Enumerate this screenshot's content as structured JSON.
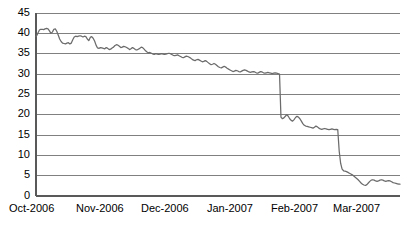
{
  "chart_data": {
    "type": "line",
    "title": "",
    "subtitle": "",
    "xlabel": "",
    "ylabel": "",
    "ylim": [
      0,
      45
    ],
    "yticks": [
      0,
      5,
      10,
      15,
      20,
      25,
      30,
      35,
      40,
      45
    ],
    "ytick_labels": [
      "0",
      "5",
      "10",
      "15",
      "20",
      "25",
      "30",
      "35",
      "40",
      "45"
    ],
    "xtick_labels": [
      "Oct-2006",
      "Nov-2006",
      "Dec-2006",
      "Jan-2007",
      "Feb-2007",
      "Mar-2007"
    ],
    "grid": "horizontal",
    "legend": "none",
    "series": [
      {
        "name": "value",
        "color": "#6b6b6b",
        "x": [
          0.0,
          0.3,
          0.6,
          0.95,
          1.3,
          1.7,
          2.1,
          2.5,
          2.9,
          3.3,
          3.7,
          4.1,
          4.5,
          4.9,
          5.3,
          5.7,
          6.1,
          6.5,
          6.9,
          7.3,
          7.7,
          8.1,
          8.5,
          8.9,
          9.3,
          9.7,
          10.1,
          10.5,
          10.9,
          11.3,
          11.7,
          12.1,
          12.5,
          12.9,
          13.3,
          13.7,
          14.1,
          14.5,
          14.9,
          15.3,
          15.7,
          16.1,
          16.5,
          16.9,
          17.3,
          17.7,
          18.1,
          18.5,
          18.9,
          19.3,
          19.7,
          20.1,
          20.5,
          20.9,
          21.3,
          21.7,
          22.1,
          22.5,
          22.9,
          23.3,
          23.7,
          24.1,
          24.5,
          24.9,
          25.3,
          25.7,
          26.1,
          26.5,
          26.9,
          27.3,
          27.7,
          28.1,
          28.5,
          28.9,
          29.3,
          29.7,
          30.1,
          30.5,
          30.9,
          31.3,
          31.7,
          32.1,
          32.5,
          32.9,
          33.3,
          33.7,
          34.1,
          34.5,
          34.9,
          35.3,
          35.7,
          36.1,
          36.5,
          36.9,
          37.3,
          37.7,
          38.1,
          38.5,
          38.9,
          39.3,
          39.7,
          40.1,
          40.5,
          40.9,
          41.3,
          41.7,
          42.1,
          42.5,
          42.9,
          43.3,
          43.7,
          44.1,
          44.5,
          44.9,
          45.3,
          45.7,
          46.1,
          46.5,
          46.9,
          47.3,
          47.7,
          48.1,
          48.5,
          48.9,
          49.3,
          49.7,
          50.1,
          50.5,
          50.9,
          51.3,
          51.7,
          52.1,
          52.5,
          52.9,
          53.3,
          53.7,
          54.1,
          54.5,
          54.9,
          55.3,
          55.7,
          56.1,
          56.5,
          56.9,
          57.3,
          57.7,
          58.1,
          58.5,
          58.9,
          59.3,
          59.7,
          60.1,
          60.5,
          60.9,
          61.3,
          61.7,
          62.1,
          62.5,
          62.9,
          63.3,
          63.7,
          64.1,
          64.5,
          64.9,
          65.3,
          65.7,
          66.1,
          66.5,
          66.9,
          67.3,
          67.7,
          68.1,
          68.5,
          68.9,
          69.3,
          69.7,
          70.1,
          70.5,
          70.9,
          71.3,
          71.7,
          72.1,
          72.5,
          72.9,
          73.3,
          73.7,
          74.1,
          74.5,
          74.9,
          75.3,
          75.7,
          76.1,
          76.5,
          76.9,
          77.3,
          77.7,
          78.1,
          78.5,
          78.9,
          79.3,
          79.7,
          80.1,
          80.5,
          80.9,
          81.3,
          81.7,
          82.1,
          82.5,
          82.9,
          83.3,
          83.7,
          84.1,
          84.5,
          84.9,
          85.3,
          85.7,
          86.1,
          86.5,
          86.9,
          87.3,
          87.7,
          88.1,
          88.5,
          88.9,
          89.3,
          89.7,
          90.1,
          90.5,
          90.9,
          91.3,
          91.7,
          92.1,
          92.5,
          92.9,
          93.3,
          93.7,
          94.1,
          94.5,
          94.9,
          95.3,
          95.7,
          96.1,
          96.5,
          96.9,
          97.3,
          97.7,
          98.1,
          98.5,
          98.9,
          99.3,
          99.7,
          100.0
        ],
        "y": [
          39.2,
          39.6,
          40.2,
          40.8,
          41.0,
          41.0,
          40.9,
          41.1,
          41.2,
          41.1,
          40.6,
          40.0,
          40.3,
          41.0,
          41.1,
          40.5,
          39.6,
          38.6,
          38.0,
          37.6,
          37.5,
          37.4,
          37.6,
          37.7,
          37.4,
          37.6,
          38.4,
          39.1,
          39.3,
          39.2,
          39.3,
          39.4,
          39.3,
          39.1,
          39.3,
          39.2,
          38.6,
          38.2,
          39.0,
          39.2,
          38.8,
          38.1,
          37.1,
          36.4,
          36.3,
          36.5,
          36.4,
          36.3,
          36.2,
          36.5,
          36.3,
          36.0,
          36.1,
          36.4,
          36.6,
          37.0,
          37.2,
          37.1,
          36.8,
          36.5,
          36.6,
          36.8,
          36.7,
          36.5,
          36.3,
          36.0,
          36.2,
          36.5,
          36.3,
          36.0,
          35.9,
          36.1,
          36.3,
          36.6,
          36.5,
          36.1,
          35.7,
          35.4,
          35.2,
          35.3,
          35.1,
          34.9,
          34.8,
          35.0,
          34.9,
          34.8,
          34.9,
          35.0,
          34.9,
          34.8,
          34.9,
          35.0,
          35.1,
          35.0,
          34.8,
          34.6,
          34.5,
          34.6,
          34.7,
          34.5,
          34.3,
          34.1,
          34.0,
          34.2,
          34.4,
          34.3,
          34.1,
          33.9,
          33.6,
          33.4,
          33.3,
          33.5,
          33.6,
          33.4,
          33.2,
          33.0,
          33.1,
          33.3,
          33.1,
          32.8,
          32.5,
          32.3,
          32.4,
          32.6,
          32.4,
          32.1,
          31.8,
          31.6,
          31.5,
          31.7,
          31.9,
          31.7,
          31.4,
          31.2,
          31.0,
          30.8,
          30.6,
          30.7,
          30.9,
          30.8,
          30.6,
          30.5,
          30.7,
          30.9,
          31.0,
          30.9,
          30.7,
          30.5,
          30.4,
          30.5,
          30.6,
          30.5,
          30.3,
          30.2,
          30.4,
          30.6,
          30.5,
          30.3,
          30.2,
          30.3,
          30.4,
          30.3,
          30.2,
          30.1,
          30.2,
          30.3,
          30.2,
          30.1,
          30.0,
          19.4,
          19.0,
          19.2,
          19.6,
          20.0,
          19.6,
          19.0,
          18.6,
          18.4,
          18.8,
          19.3,
          19.6,
          19.4,
          19.0,
          18.4,
          17.8,
          17.4,
          17.2,
          17.1,
          17.0,
          16.9,
          16.8,
          16.7,
          16.9,
          17.2,
          17.0,
          16.7,
          16.5,
          16.4,
          16.5,
          16.6,
          16.5,
          16.4,
          16.3,
          16.4,
          16.5,
          16.4,
          16.3,
          16.4,
          16.3,
          11.0,
          8.0,
          6.6,
          6.2,
          6.1,
          6.0,
          5.8,
          5.6,
          5.4,
          5.2,
          4.9,
          4.6,
          4.3,
          4.0,
          3.6,
          3.2,
          2.9,
          2.7,
          2.6,
          2.8,
          3.2,
          3.6,
          3.9,
          4.0,
          3.9,
          3.7,
          3.6,
          3.7,
          3.9,
          4.0,
          3.9,
          3.7,
          3.6,
          3.7,
          3.8,
          3.7,
          3.5,
          3.3,
          3.2,
          3.1,
          3.0,
          2.9,
          2.9
        ]
      }
    ]
  },
  "axes": {
    "y_labels": [
      "45",
      "40",
      "35",
      "30",
      "25",
      "20",
      "15",
      "10",
      "5",
      "0"
    ],
    "x_labels": [
      "Oct-2006",
      "Nov-2006",
      "Dec-2006",
      "Jan-2007",
      "Feb-2007",
      "Mar-2007"
    ]
  },
  "colors": {
    "series": "#6b6b6b",
    "grid": "#808080",
    "axis": "#595959",
    "text": "#000000",
    "background": "#ffffff"
  }
}
